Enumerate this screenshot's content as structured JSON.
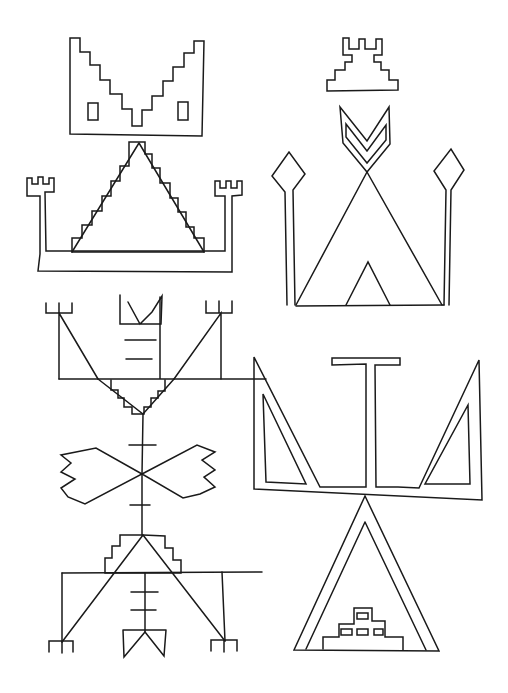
{
  "canvas": {
    "width": 508,
    "height": 693,
    "background": "#ffffff",
    "stroke": "#1a1a1a"
  },
  "figures": [
    {
      "name": "stepped-v-bowl",
      "paths": [
        "M70,38 L80,38 L80,52 L90,52 L90,65 L100,65 L100,80 L110,80 L110,94 L122,94 L122,109 L132,109 L132,126 L142,126 L142,110 L152,110 L152,96 L163,96 L163,81 L173,81 L173,67 L184,67 L184,53 L194,53 L194,41 L204,41 L202,136 L70,134 Z",
        "M88,103 L98,103 L98,120 L88,120 Z",
        "M178,102 L188,102 L188,120 L178,120 Z"
      ]
    },
    {
      "name": "stepped-pyramid-with-towers",
      "paths": [
        "M129,142 L145,142 L145,154 L152,154 L152,168 L160,168 L160,183 L170,183 L170,198 L178,198 L178,212 L186,212 L186,227 L194,227 L194,238 L204,238 L204,252 L72,252 L72,238 L82,238 L82,225 L92,225 L92,211 L102,211 L102,196 L111,196 L111,181 L120,181 L120,166 L129,166 Z",
        "M139,143 L72,252 M139,143 L204,252",
        "M40,254 L40,196 L27,196 L27,178 L32,178 L32,184 L38,184 L38,177 L43,177 L43,184 L49,184 L49,178 L54,178 L54,192 L45,192 L46,251 L225,251 L225,196 L215,196 L215,181 L220,181 L220,188 L226,188 L226,181 L231,181 L231,188 L237,188 L237,181 L242,181 L242,195 L232,196 L232,272 L38,271 Z"
      ]
    },
    {
      "name": "crowned-stepped-mound",
      "paths": [
        "M343,38 L349,38 L349,49 L359,49 L359,39 L365,39 L365,49 L376,49 L376,39 L382,39 L382,55 L374,55 L374,62 L381,62 L381,70 L389,70 L389,80 L398,80 L398,90 L327,91 L327,80 L335,80 L335,70 L345,70 L345,62 L352,62 L352,55 L343,55 Z"
      ]
    },
    {
      "name": "chevron-tipi-with-diamond-staffs",
      "paths": [
        "M340,107 L367,141 L389,107 L390,144 L367,172 L343,143 Z",
        "M346,124 L367,151 L386,125 L386,140 L367,163 L346,137 Z",
        "M367,172 L296,305 M367,172 L442,305",
        "M296,306 L444,305",
        "M346,305 L368,262 L390,305",
        "M287,305 L285,192 L272,176 L289,152 L305,174 L293,190 L295,305",
        "M444,305 L446,190 L434,171 L451,149 L464,170 L451,190 L449,305"
      ]
    },
    {
      "name": "mirrored-totem",
      "paths": [
        "M160,379 L160,297 M59,379 L266,379",
        "M120,295 L120,324 L140,324 L161,324 L162,296 L152,312 L140,324 L128,302",
        "M125,340 L156,340 M126,359 L152,359",
        "M59,379 L59,313 M59,313 L98,379 M221,379 L221,313 L174,379",
        "M46,303 L46,313 L72,313 L72,303 M59,303 L59,313",
        "M206,301 L206,313 L232,313 L232,301 M219,301 L219,313",
        "M111,380 L111,390 L118,390 L118,398 L124,398 L124,407 L132,407 L132,414 L144,414 L144,407 L151,407 L151,398 L158,398 L158,391 L165,391 L165,380",
        "M98,379 L143,414 L174,379",
        "M143,414 L142,474",
        "M129,445 L156,445 M130,505 L150,505",
        "M142,474 L96,448 L61,455 L71,463 L61,472 L75,479 L61,488 L68,497 L85,504 L142,474 Z",
        "M142,474 L197,445 L215,452 L202,460 L215,470 L204,477 L215,487 L200,494 L183,498 Z",
        "M142,474 L142,535",
        "M143,535 L120,535 L120,546 L112,546 L112,558 L105,558 L105,573 L181,573 L181,560 L173,560 L173,548 L165,548 L165,536 L143,535",
        "M62,573 L262,572",
        "M143,535 L62,642 M143,535 L225,641",
        "M62,573 L62,642 M222,572 L225,641",
        "M145,573 L145,632",
        "M131,592 L158,592 M131,610 L156,610",
        "M123,630 L166,630 M123,630 L124,657 L145,632 L164,656 L166,630",
        "M49,652 L49,641 L73,641 L73,652 M62,641 L62,653",
        "M211,651 L211,640 L237,640 L237,651 M224,640 L224,652"
      ]
    },
    {
      "name": "t-staff-with-triangle-wings",
      "paths": [
        "M332,358 L400,358 L400,365 L375,365 L376,487 L398,487 L419,488 L479,360 L482,500 L254,489 L254,357 L320,487 L366,487 L366,364 L332,365 Z",
        "M263,394 L306,484 L266,482 Z",
        "M468,405 L470,484 L425,484 Z",
        "M365,496 L294,650 L439,651 Z",
        "M365,522 L306,649 M365,522 L426,650",
        "M323,649 L323,637 L339,637 L339,624 L354,624 L354,608 L372,608 L372,621 L385,621 L385,637 L403,637 L403,650",
        "M357,613 L368,613 L368,619 L357,619 Z",
        "M341,629 L352,629 L352,635 L341,635 Z",
        "M357,629 L368,629 L368,635 L357,635 Z",
        "M374,629 L383,629 L383,635 L374,635 Z"
      ]
    }
  ]
}
